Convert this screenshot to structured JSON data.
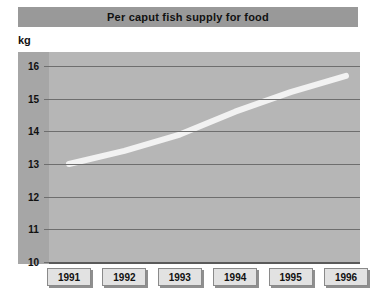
{
  "chart_data": {
    "type": "line",
    "title": "Per caput fish supply for food",
    "xlabel": "",
    "ylabel": "kg",
    "unit_label": "kg",
    "categories": [
      "1991",
      "1992",
      "1993",
      "1994",
      "1995",
      "1996"
    ],
    "x": [
      1991,
      1992,
      1993,
      1994,
      1995,
      1996
    ],
    "values": [
      13.0,
      13.4,
      13.9,
      14.6,
      15.2,
      15.7
    ],
    "series": [
      {
        "name": "Per caput fish supply for food",
        "values": [
          13.0,
          13.4,
          13.9,
          14.6,
          15.2,
          15.7
        ],
        "color": "#f2f2f2"
      }
    ],
    "ylim": [
      10,
      16
    ],
    "yticks": [
      16,
      15,
      14,
      13,
      12,
      11,
      10
    ],
    "ytick_labels": [
      "16",
      "15",
      "14",
      "13",
      "12",
      "11",
      "10"
    ],
    "grid": true,
    "legend": false,
    "legend_position": "none"
  },
  "title_bar": {
    "text": "Per caput fish supply for food",
    "background": "#999999",
    "text_color": "#111111"
  },
  "axes": {
    "unit": "kg",
    "y_ticks": [
      "16",
      "15",
      "14",
      "13",
      "12",
      "11",
      "10"
    ],
    "x_ticks": [
      "1991",
      "1992",
      "1993",
      "1994",
      "1995",
      "1996"
    ]
  },
  "colors": {
    "title_bar": "#999999",
    "plot_background": "#b6b6b6",
    "y_band_background": "#a6a6a6",
    "gridline": "#6e6e6e",
    "data_line": "#f2f2f2",
    "year_box": "#e2e2e2",
    "page_background": "#ffffff"
  }
}
